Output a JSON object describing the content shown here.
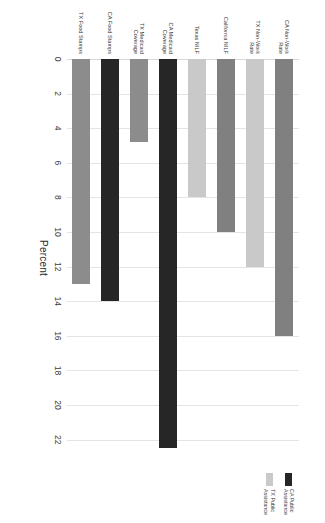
{
  "chart_data": {
    "type": "bar",
    "orientation": "horizontal",
    "title": "",
    "xlabel": "Percent",
    "ylabel": "",
    "xlim": [
      0,
      23
    ],
    "grid": true,
    "legend_position": "right",
    "ticks": [
      "0",
      "2",
      "4",
      "6",
      "8",
      "10",
      "12",
      "14",
      "16",
      "18",
      "20",
      "22"
    ],
    "tick_values": [
      0,
      2,
      4,
      6,
      8,
      10,
      12,
      14,
      16,
      18,
      20,
      22
    ],
    "categories": [
      "CA Non-Work Rate",
      "TX Non-Work Rate",
      "California NILF",
      "Texas NILF",
      "CA Medicaid Coverage",
      "TX Medicaid Coverage",
      "CA Food Stamps",
      "TX Food Stamps"
    ],
    "values": [
      16.0,
      12.0,
      10.0,
      8.0,
      22.5,
      4.8,
      14.0,
      13.0
    ],
    "colors": [
      "#808080",
      "#c9c9c9",
      "#808080",
      "#c9c9c9",
      "#262626",
      "#8c8c8c",
      "#262626",
      "#8c8c8c"
    ],
    "bars": [
      {
        "label": "CA Non-Work Rate",
        "value": 16.0,
        "color": "#808080"
      },
      {
        "label": "TX Non-Work Rate",
        "value": 12.0,
        "color": "#c9c9c9"
      },
      {
        "label": "California NILF",
        "value": 10.0,
        "color": "#808080"
      },
      {
        "label": "Texas NILF",
        "value": 8.0,
        "color": "#c9c9c9"
      },
      {
        "label": "CA Medicaid Coverage",
        "value": 22.5,
        "color": "#262626"
      },
      {
        "label": "TX Medicaid Coverage",
        "value": 4.8,
        "color": "#8c8c8c"
      },
      {
        "label": "CA Food Stamps",
        "value": 14.0,
        "color": "#262626"
      },
      {
        "label": "TX Food Stamps",
        "value": 13.0,
        "color": "#8c8c8c"
      }
    ],
    "legend": [
      {
        "label": "CA Public Assistance",
        "color": "#262626"
      },
      {
        "label": "TX Public Assistance",
        "color": "#c9c9c9"
      }
    ],
    "axis_title": "Percent"
  },
  "accent": {
    "dark": "#262626",
    "mid": "#808080",
    "light": "#c9c9c9",
    "grid": "#e4e4e4",
    "background": "#ffffff"
  }
}
